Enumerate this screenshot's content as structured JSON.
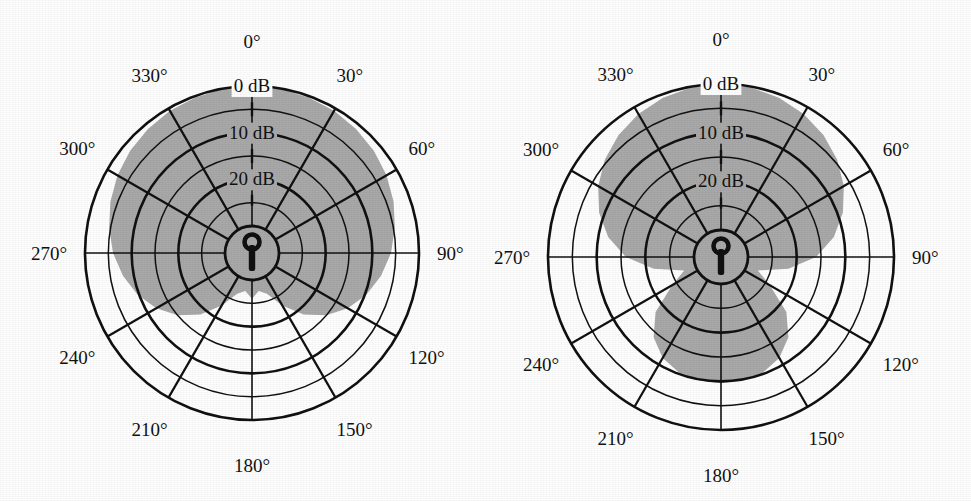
{
  "figure": {
    "background_color": "#ffffff",
    "ink_color": "#111111",
    "lobe_fill_color": "#a9a9a9",
    "grid_stroke_color": "#111111"
  },
  "plots": [
    {
      "id": "left-polar-plot",
      "name": "cardioid-polar-pattern",
      "center": {
        "x": 252,
        "y": 253
      },
      "outer_radius": 167,
      "hub_radius": 27,
      "icon": "microphone-keyhole-icon",
      "angle_labels": [
        "0°",
        "30°",
        "60°",
        "90°",
        "120°",
        "150°",
        "180°",
        "210°",
        "240°",
        "270°",
        "300°",
        "330°"
      ],
      "angle_values": [
        0,
        30,
        60,
        90,
        120,
        150,
        180,
        210,
        240,
        270,
        300,
        330
      ],
      "db_labels": [
        "0 dB",
        "10 dB",
        "20 dB"
      ],
      "db_label_values": [
        0,
        10,
        20
      ]
    },
    {
      "id": "right-polar-plot",
      "name": "supercardioid-polar-pattern",
      "center": {
        "x": 236,
        "y": 257
      },
      "outer_radius": 173,
      "hub_radius": 27,
      "icon": "microphone-keyhole-icon",
      "angle_labels": [
        "0°",
        "30°",
        "60°",
        "90°",
        "120°",
        "150°",
        "180°",
        "210°",
        "240°",
        "270°",
        "300°",
        "330°"
      ],
      "angle_values": [
        0,
        30,
        60,
        90,
        120,
        150,
        180,
        210,
        240,
        270,
        300,
        330
      ],
      "db_labels": [
        "0 dB",
        "10 dB",
        "20 dB"
      ],
      "db_label_values": [
        0,
        10,
        20
      ]
    }
  ],
  "chart_data": [
    {
      "type": "line",
      "subtype": "polar",
      "title": "",
      "xlabel": "",
      "ylabel": "",
      "legend": [],
      "grid": true,
      "angular_axis": {
        "unit": "degree",
        "direction": "clockwise",
        "zero_at": "top",
        "tick_step": 30,
        "tick_labels": [
          "0°",
          "30°",
          "60°",
          "90°",
          "120°",
          "150°",
          "180°",
          "210°",
          "240°",
          "270°",
          "300°",
          "330°"
        ],
        "tick_values": [
          0,
          30,
          60,
          90,
          120,
          150,
          180,
          210,
          240,
          270,
          300,
          330
        ]
      },
      "radial_axis": {
        "unit": "dB attenuation",
        "labels": [
          "0 dB",
          "10 dB",
          "20 dB"
        ],
        "label_values": [
          0,
          10,
          20
        ],
        "ring_values": [
          0,
          5,
          10,
          15,
          20,
          25
        ],
        "rlim": [
          0,
          30
        ],
        "direction": "inward"
      },
      "series": [
        {
          "name": "cardioid response",
          "fill": "#a9a9a9",
          "angles": [
            0,
            10,
            20,
            30,
            40,
            50,
            60,
            70,
            80,
            90,
            100,
            110,
            120,
            130,
            140,
            150,
            160,
            170,
            180,
            190,
            200,
            210,
            220,
            230,
            240,
            250,
            260,
            270,
            280,
            290,
            300,
            310,
            320,
            330,
            340,
            350,
            360
          ],
          "values_db": [
            0,
            0.1,
            0.3,
            0.6,
            1.1,
            1.7,
            2.5,
            3.5,
            4.7,
            6.0,
            7.7,
            9.7,
            12.1,
            15.0,
            18.6,
            22.8,
            26.5,
            27.5,
            26.0,
            27.5,
            26.5,
            22.8,
            18.6,
            15.0,
            12.1,
            9.7,
            7.7,
            6.0,
            4.7,
            3.5,
            2.5,
            1.7,
            1.1,
            0.6,
            0.3,
            0.1,
            0
          ]
        }
      ]
    },
    {
      "type": "line",
      "subtype": "polar",
      "title": "",
      "xlabel": "",
      "ylabel": "",
      "legend": [],
      "grid": true,
      "angular_axis": {
        "unit": "degree",
        "direction": "clockwise",
        "zero_at": "top",
        "tick_step": 30,
        "tick_labels": [
          "0°",
          "30°",
          "60°",
          "90°",
          "120°",
          "150°",
          "180°",
          "210°",
          "240°",
          "270°",
          "300°",
          "330°"
        ],
        "tick_values": [
          0,
          30,
          60,
          90,
          120,
          150,
          180,
          210,
          240,
          270,
          300,
          330
        ]
      },
      "radial_axis": {
        "unit": "dB attenuation",
        "labels": [
          "0 dB",
          "10 dB",
          "20 dB"
        ],
        "label_values": [
          0,
          10,
          20
        ],
        "ring_values": [
          0,
          5,
          10,
          15,
          20,
          25
        ],
        "rlim": [
          0,
          30
        ],
        "direction": "inward"
      },
      "series": [
        {
          "name": "supercardioid response",
          "fill": "#a9a9a9",
          "angles": [
            0,
            10,
            20,
            30,
            40,
            50,
            60,
            70,
            80,
            90,
            100,
            110,
            120,
            130,
            140,
            150,
            160,
            170,
            180,
            190,
            200,
            210,
            220,
            230,
            240,
            250,
            260,
            270,
            280,
            290,
            300,
            310,
            320,
            330,
            340,
            350,
            360
          ],
          "values_db": [
            0,
            0.2,
            0.7,
            1.6,
            2.8,
            4.4,
            6.4,
            8.9,
            12.0,
            16.0,
            21.5,
            27.5,
            24.0,
            18.0,
            14.0,
            11.6,
            10.3,
            9.8,
            9.6,
            9.8,
            10.3,
            11.6,
            14.0,
            18.0,
            24.0,
            27.5,
            21.5,
            16.0,
            12.0,
            8.9,
            6.4,
            4.4,
            2.8,
            1.6,
            0.7,
            0.2,
            0
          ]
        }
      ]
    }
  ]
}
